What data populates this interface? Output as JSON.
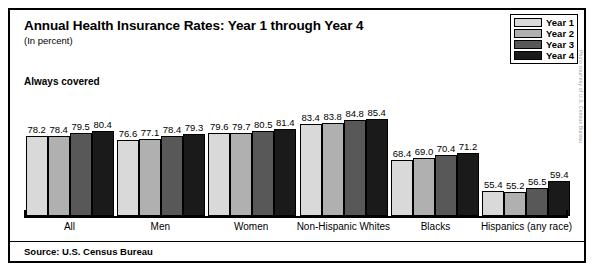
{
  "figure": {
    "title_lead": "Annual Health Insurance Rates:",
    "title_rest": " Year 1 through Year 4",
    "subtitle": "(In percent)",
    "section_label": "Always covered",
    "source": "Source: U.S. Census Bureau",
    "side_credit": "Photo courtesy of U.S. Census Bureau"
  },
  "legend": {
    "items": [
      {
        "label": "Year 1",
        "color": "#d9d9d9"
      },
      {
        "label": "Year 2",
        "color": "#b0b0b0"
      },
      {
        "label": "Year 3",
        "color": "#585858"
      },
      {
        "label": "Year 4",
        "color": "#1a1a1a"
      }
    ]
  },
  "chart_data": {
    "type": "bar",
    "title": "Annual Health Insurance Rates: Year 1 through Year 4",
    "subtitle": "(In percent)",
    "xlabel": "",
    "ylabel": "",
    "grid": false,
    "legend_position": "top-right",
    "baseline": 45,
    "ylim": [
      45,
      90
    ],
    "categories": [
      "All",
      "Men",
      "Women",
      "Non-Hispanic Whites",
      "Blacks",
      "Hispanics (any race)"
    ],
    "series": [
      {
        "name": "Year 1",
        "color": "#d9d9d9",
        "values": [
          78.2,
          76.6,
          79.6,
          83.4,
          68.4,
          55.4
        ]
      },
      {
        "name": "Year 2",
        "color": "#b0b0b0",
        "values": [
          78.4,
          77.1,
          79.7,
          83.8,
          69.0,
          55.2
        ]
      },
      {
        "name": "Year 3",
        "color": "#585858",
        "values": [
          79.5,
          78.4,
          80.5,
          84.8,
          70.4,
          56.5
        ]
      },
      {
        "name": "Year 4",
        "color": "#1a1a1a",
        "values": [
          80.4,
          79.3,
          81.4,
          85.4,
          71.2,
          59.4
        ]
      }
    ],
    "value_labels": [
      [
        "78.2",
        "78.4",
        "79.5",
        "80.4"
      ],
      [
        "76.6",
        "77.1",
        "78.4",
        "79.3"
      ],
      [
        "79.6",
        "79.7",
        "80.5",
        "81.4"
      ],
      [
        "83.4",
        "83.8",
        "84.8",
        "85.4"
      ],
      [
        "68.4",
        "69.0",
        "70.4",
        "71.2"
      ],
      [
        "55.4",
        "55.2",
        "56.5",
        "59.4"
      ]
    ]
  }
}
